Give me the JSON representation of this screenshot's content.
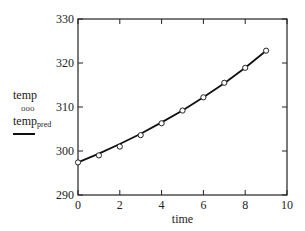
{
  "chart_data": {
    "type": "scatter+line",
    "title": "",
    "xlabel": "time",
    "ylabel": "",
    "xlim": [
      0,
      10
    ],
    "ylim": [
      290,
      330
    ],
    "xticks": [
      0,
      2,
      4,
      6,
      8,
      10
    ],
    "yticks": [
      290,
      300,
      310,
      320,
      330
    ],
    "grid": false,
    "legend_position": "left",
    "series": [
      {
        "name": "temp",
        "style": "markers (open circles, ooo)",
        "x": [
          0,
          1,
          2,
          3,
          4,
          5,
          6,
          7,
          8,
          9
        ],
        "values": [
          297.4,
          299.0,
          301.0,
          303.6,
          306.3,
          309.2,
          312.2,
          315.5,
          318.9,
          322.8
        ]
      },
      {
        "name": "temp_pred",
        "style": "solid line",
        "x": [
          0,
          1,
          2,
          3,
          4,
          5,
          6,
          7,
          8,
          9
        ],
        "values": [
          297.4,
          299.4,
          301.6,
          303.9,
          306.5,
          309.2,
          312.2,
          315.4,
          318.9,
          322.8
        ]
      }
    ]
  },
  "legend": {
    "series1_label": "temp",
    "series1_marker": "ooo",
    "series2_label": "temp",
    "series2_subscript": "pred"
  }
}
